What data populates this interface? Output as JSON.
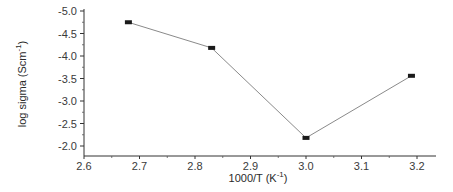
{
  "chart_data": {
    "type": "line",
    "title": "",
    "xlabel": "1000/T (K",
    "xlabel_sup": "-1",
    "xlabel_close": ")",
    "ylabel": "log sigma (Scm",
    "ylabel_sup": "-1",
    "ylabel_close": ")",
    "xlim": [
      2.6,
      3.25
    ],
    "ylim": [
      -5.0,
      -1.78
    ],
    "y_inverted": true,
    "grid": false,
    "legend": null,
    "x_ticks": [
      "2.6",
      "2.7",
      "2.8",
      "2.9",
      "3.0",
      "3.1",
      "3.2"
    ],
    "y_ticks": [
      "-5.0",
      "-4.5",
      "-4.0",
      "-3.5",
      "-3.0",
      "-2.5",
      "-2.0"
    ],
    "series": [
      {
        "name": "log sigma",
        "marker": "square",
        "line_color": "#8a8a8a",
        "marker_color": "#1a1a1a",
        "x": [
          2.68,
          2.83,
          3.0,
          3.19
        ],
        "y": [
          -4.75,
          -4.18,
          -2.18,
          -3.56
        ]
      }
    ]
  }
}
